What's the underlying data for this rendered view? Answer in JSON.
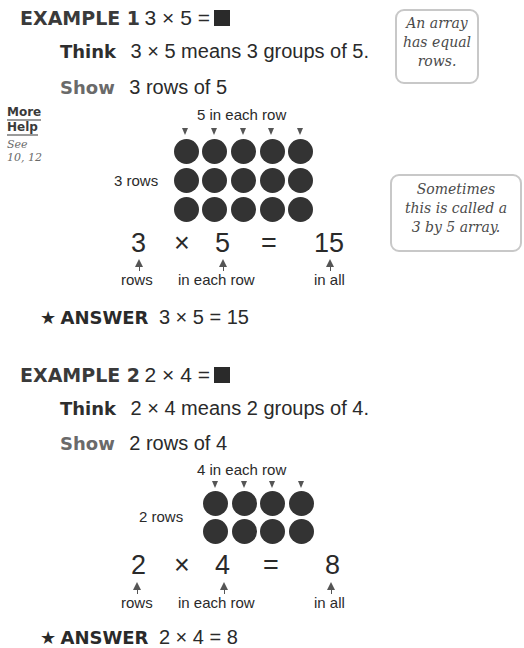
{
  "example1": {
    "label": "EXAMPLE 1",
    "equation": "3 × 5 =",
    "think_label": "Think",
    "think_text": "3 × 5 means 3 groups of 5.",
    "show_label": "Show",
    "show_text": "3 rows of 5",
    "top_caption": "5 in each row",
    "side_caption": "3 rows",
    "rows": 3,
    "cols": 5,
    "eq_parts": [
      "3",
      "×",
      "5",
      "=",
      "15"
    ],
    "eq_captions": [
      "rows",
      "in each row",
      "in all"
    ],
    "answer_label": "ANSWER",
    "answer_text": "3 × 5 = 15"
  },
  "example2": {
    "label": "EXAMPLE 2",
    "equation": "2 × 4 =",
    "think_label": "Think",
    "think_text": "2 × 4 means 2 groups of 4.",
    "show_label": "Show",
    "show_text": "2 rows of 4",
    "top_caption": "4 in each row",
    "side_caption": "2 rows",
    "rows": 2,
    "cols": 4,
    "eq_parts": [
      "2",
      "×",
      "4",
      "=",
      "8"
    ],
    "eq_captions": [
      "rows",
      "in each row",
      "in all"
    ],
    "answer_label": "ANSWER",
    "answer_text": "2 × 4 = 8"
  },
  "sidebar": {
    "more_help_line1": "More",
    "more_help_line2": "Help",
    "see_line1": "See",
    "see_line2": "10, 12"
  },
  "notes": {
    "note1": [
      "An array",
      "has equal",
      "rows."
    ],
    "note2": [
      "Sometimes",
      "this is called a",
      "3 by 5 array."
    ]
  },
  "icons": {
    "answer_icon": "★",
    "unknown_box": "black-square"
  }
}
